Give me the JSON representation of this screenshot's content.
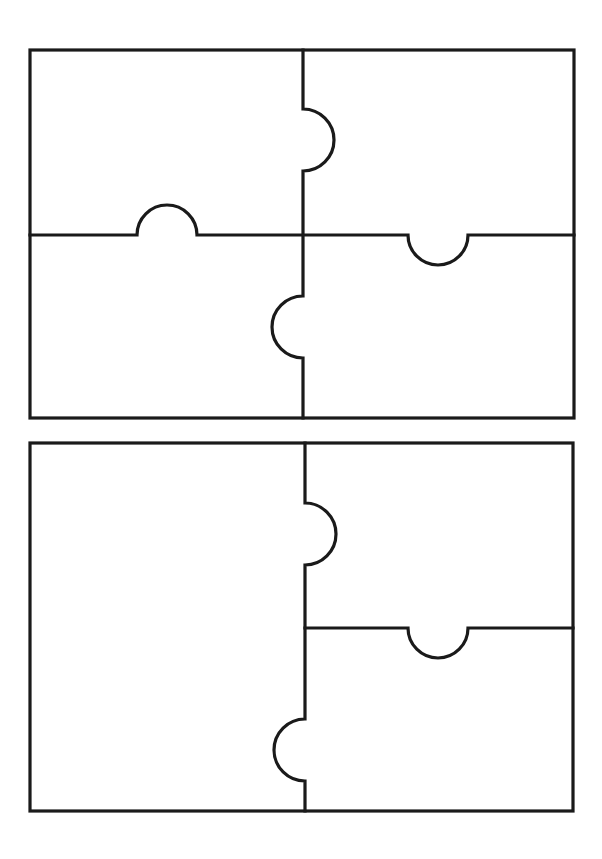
{
  "diagram": {
    "type": "puzzle-piece-templates",
    "stroke_color": "#1a1a1a",
    "background_color": "#ffffff",
    "templates": [
      {
        "name": "four-piece-template",
        "pieces": 4,
        "frame": {
          "x": 30,
          "y": 50,
          "width": 544,
          "height": 368
        },
        "dividers": {
          "vertical_x": 303,
          "horizontal_y": 235,
          "horizontal_span": "full"
        },
        "knobs": [
          {
            "edge": "vertical-upper",
            "direction": "right",
            "center": [
              303,
              140
            ],
            "radius": 31
          },
          {
            "edge": "horizontal-left",
            "direction": "up",
            "center": [
              167,
              235
            ],
            "radius": 30
          },
          {
            "edge": "horizontal-right",
            "direction": "down",
            "center": [
              438,
              235
            ],
            "radius": 30
          },
          {
            "edge": "vertical-lower",
            "direction": "left",
            "center": [
              303,
              327
            ],
            "radius": 31
          }
        ]
      },
      {
        "name": "three-piece-template",
        "pieces": 3,
        "frame": {
          "x": 30,
          "y": 443,
          "width": 543,
          "height": 368
        },
        "dividers": {
          "vertical_x": 305,
          "horizontal_y": 628,
          "horizontal_span": "right-half"
        },
        "knobs": [
          {
            "edge": "vertical-upper",
            "direction": "right",
            "center": [
              305,
              534
            ],
            "radius": 31
          },
          {
            "edge": "horizontal-right",
            "direction": "down",
            "center": [
              438,
              628
            ],
            "radius": 30
          },
          {
            "edge": "vertical-lower",
            "direction": "left",
            "center": [
              305,
              750
            ],
            "radius": 31
          }
        ]
      }
    ]
  }
}
